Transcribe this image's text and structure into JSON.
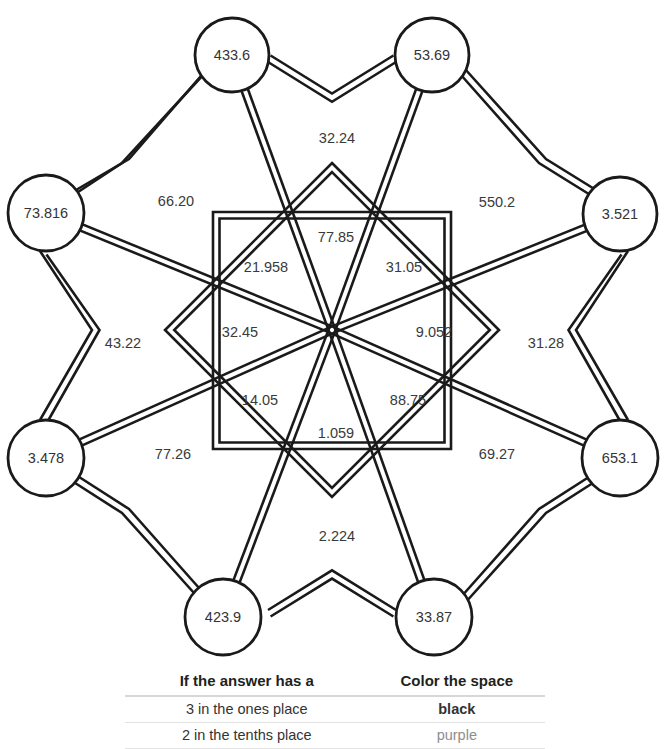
{
  "figure": {
    "name": "decimal-star-coloring-puzzle",
    "center": {
      "x": 332,
      "y": 330
    },
    "outer_nodes": [
      {
        "id": "node-top-left",
        "label": "433.6",
        "x": 232,
        "y": 55,
        "r": 37
      },
      {
        "id": "node-top-right",
        "label": "53.69",
        "x": 432,
        "y": 55,
        "r": 37
      },
      {
        "id": "node-left-upper",
        "label": "73.816",
        "x": 46,
        "y": 213,
        "r": 38
      },
      {
        "id": "node-right-upper",
        "label": "3.521",
        "x": 620,
        "y": 214,
        "r": 37
      },
      {
        "id": "node-left-lower",
        "label": "3.478",
        "x": 46,
        "y": 458,
        "r": 38
      },
      {
        "id": "node-right-lower",
        "label": "653.1",
        "x": 620,
        "y": 458,
        "r": 38
      },
      {
        "id": "node-bottom-left",
        "label": "423.9",
        "x": 223,
        "y": 617,
        "r": 38
      },
      {
        "id": "node-bottom-right",
        "label": "33.87",
        "x": 434,
        "y": 617,
        "r": 38
      }
    ],
    "outer_space_labels": [
      {
        "id": "space-top",
        "label": "32.24",
        "x": 337,
        "y": 139
      },
      {
        "id": "space-upper-left",
        "label": "66.20",
        "x": 176,
        "y": 202
      },
      {
        "id": "space-upper-right",
        "label": "550.2",
        "x": 497,
        "y": 203
      },
      {
        "id": "space-left",
        "label": "43.22",
        "x": 123,
        "y": 344
      },
      {
        "id": "space-right",
        "label": "31.28",
        "x": 546,
        "y": 344
      },
      {
        "id": "space-lower-left",
        "label": "77.26",
        "x": 173,
        "y": 455
      },
      {
        "id": "space-lower-right",
        "label": "69.27",
        "x": 497,
        "y": 455
      },
      {
        "id": "space-bottom",
        "label": "2.224",
        "x": 337,
        "y": 537
      }
    ],
    "inner_space_labels": [
      {
        "id": "inner-top",
        "label": "77.85",
        "x": 336,
        "y": 238
      },
      {
        "id": "inner-upper-left",
        "label": "21.958",
        "x": 266,
        "y": 268
      },
      {
        "id": "inner-upper-right",
        "label": "31.05",
        "x": 404,
        "y": 268
      },
      {
        "id": "inner-left",
        "label": "32.45",
        "x": 240,
        "y": 333
      },
      {
        "id": "inner-right",
        "label": "9.052",
        "x": 434,
        "y": 333
      },
      {
        "id": "inner-lower-left",
        "label": "14.05",
        "x": 260,
        "y": 401
      },
      {
        "id": "inner-lower-right",
        "label": "88.75",
        "x": 408,
        "y": 401
      },
      {
        "id": "inner-bottom",
        "label": "1.059",
        "x": 336,
        "y": 434
      }
    ]
  },
  "key_table": {
    "headers": {
      "condition": "If the answer has a",
      "color": "Color the space"
    },
    "rows": [
      {
        "condition": "3 in the ones place",
        "color": "black",
        "swatch": "#1a1a1a"
      },
      {
        "condition": "2 in the tenths place",
        "color": "purple",
        "swatch": "#8d8d8d"
      }
    ]
  },
  "clipped_header": {
    "text": ""
  }
}
